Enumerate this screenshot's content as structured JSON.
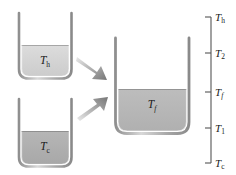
{
  "figure": {
    "background_color": "#ffffff"
  },
  "beakers": [
    {
      "id": "hot",
      "name": "hot-water-beaker",
      "label_base": "T",
      "label_sub": "h",
      "fill_color": "#d4d4d4",
      "glass_color": "#9a9a9a"
    },
    {
      "id": "cold",
      "name": "cold-water-beaker",
      "label_base": "T",
      "label_sub": "c",
      "fill_color": "#b0b0b0",
      "glass_color": "#9a9a9a"
    },
    {
      "id": "final",
      "name": "mixture-beaker",
      "label_base": "T",
      "label_sub": "f",
      "fill_color": "#b8b8b8",
      "glass_color": "#9a9a9a"
    }
  ],
  "arrows": [
    {
      "id": "hot-arrow",
      "name": "hot-pour-arrow",
      "direction": "down-right",
      "color": "#8c8c8c"
    },
    {
      "id": "cold-arrow",
      "name": "cold-pour-arrow",
      "direction": "up-right",
      "color": "#8c8c8c"
    }
  ],
  "scale": {
    "name": "temperature-scale",
    "axis_color": "#555555",
    "ticks": [
      {
        "base": "T",
        "sub": "h",
        "sub_italic": false,
        "y": 17
      },
      {
        "base": "T",
        "sub": "2",
        "sub_italic": false,
        "y": 53
      },
      {
        "base": "T",
        "sub": "f",
        "sub_italic": true,
        "y": 92
      },
      {
        "base": "T",
        "sub": "1",
        "sub_italic": false,
        "y": 128
      },
      {
        "base": "T",
        "sub": "c",
        "sub_italic": false,
        "y": 163
      }
    ]
  }
}
